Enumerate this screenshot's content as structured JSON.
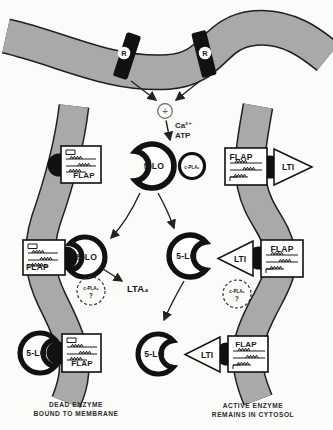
{
  "labels": {
    "receptor": "R",
    "stimulus_plus": "+",
    "calcium": "Ca²⁺",
    "atp": "ATP",
    "five_lo": "5-LO",
    "cpla2": "c-PLA₂",
    "cpla2_question": "?",
    "flap": "FLAP",
    "lti": "LTI",
    "lta4": "LTA₄"
  },
  "captions": {
    "left_line1": "DEAD ENZYME",
    "left_line2": "BOUND TO MEMBRANE",
    "right_line1": "ACTIVE ENZYME",
    "right_line2": "REMAINS IN CYTOSOL"
  },
  "colors": {
    "membrane": "#a9a9a9",
    "membrane_outline": "#1f1f1f",
    "ink": "#1a1a1a",
    "background": "#fbfbfa"
  }
}
